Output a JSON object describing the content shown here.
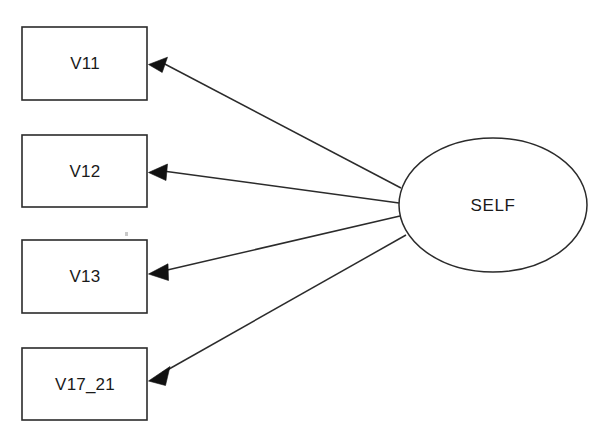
{
  "diagram": {
    "type": "sem-path-diagram",
    "background_color": "#ffffff",
    "stroke_color": "#2b2b2b",
    "text_color": "#1a1a1a",
    "latent": {
      "id": "self",
      "label": "SELF",
      "shape": "ellipse",
      "cx": 493,
      "cy": 205,
      "rx": 94,
      "ry": 67
    },
    "indicators": [
      {
        "id": "v11",
        "label": "V11",
        "shape": "rectangle",
        "x": 22,
        "y": 27,
        "width": 125,
        "height": 73,
        "label_cx": 85,
        "label_cy": 64
      },
      {
        "id": "v12",
        "label": "V12",
        "shape": "rectangle",
        "x": 22,
        "y": 135,
        "width": 125,
        "height": 72,
        "label_cx": 85,
        "label_cy": 172
      },
      {
        "id": "v13",
        "label": "V13",
        "shape": "rectangle",
        "x": 22,
        "y": 240,
        "width": 125,
        "height": 73,
        "label_cx": 85,
        "label_cy": 277
      },
      {
        "id": "v17_21",
        "label": "V17_21",
        "shape": "rectangle",
        "x": 22,
        "y": 348,
        "width": 125,
        "height": 72,
        "label_cx": 85,
        "label_cy": 385
      }
    ],
    "paths": [
      {
        "id": "self-to-v11",
        "from": "self",
        "to": "v11",
        "from_x": 401,
        "from_y": 188,
        "to_x": 149,
        "to_y": 64,
        "arrow": "to"
      },
      {
        "id": "self-to-v12",
        "from": "self",
        "to": "v12",
        "from_x": 399,
        "from_y": 203,
        "to_x": 149,
        "to_y": 172,
        "arrow": "to"
      },
      {
        "id": "self-to-v13",
        "from": "self",
        "to": "v13",
        "from_x": 400,
        "from_y": 216,
        "to_x": 149,
        "to_y": 274,
        "arrow": "to"
      },
      {
        "id": "self-to-v17_21",
        "from": "self",
        "to": "v17_21",
        "from_x": 406,
        "from_y": 235,
        "to_x": 149,
        "to_y": 381,
        "arrow": "to"
      }
    ]
  }
}
